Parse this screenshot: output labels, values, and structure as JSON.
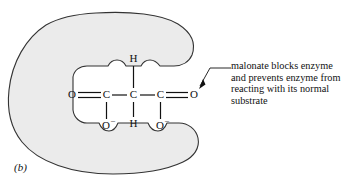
{
  "figure": {
    "panel_label": "(b)",
    "colors": {
      "enzyme_fill": "#ebebeb",
      "outline": "#333333",
      "background": "#ffffff",
      "text": "#111111"
    }
  },
  "annotation": {
    "lines": [
      "malonate blocks enzyme",
      "and prevents enzyme from",
      "reacting with its normal",
      "substrate"
    ],
    "full_text": "malonate blocks enzyme and prevents enzyme from reacting with its normal substrate",
    "leader_icon": "arrow-icon"
  },
  "molecule": {
    "name": "malonate",
    "atoms": {
      "left_oxygen": "O",
      "left_carbon": "C",
      "center_carbon": "C",
      "right_carbon": "C",
      "right_oxygen": "O",
      "top_hydrogen": "H",
      "bottom_hydrogen": "H",
      "left_oxide": "O",
      "left_oxide_charge": "–",
      "right_oxide": "O",
      "right_oxide_charge": "–"
    },
    "bonds": {
      "left_carbonyl": "double",
      "right_carbonyl": "double",
      "backbone": "single",
      "hydrogen_bonds": "single",
      "oxide_bonds": "single"
    }
  },
  "enzyme": {
    "shape": "c-shaped-active-site",
    "label": "enzyme"
  }
}
